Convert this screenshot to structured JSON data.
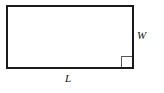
{
  "figure": {
    "type": "geometry-diagram",
    "shape": "rectangle",
    "background_color": "#ffffff",
    "stroke_color": "#1a1a1a",
    "stroke_width_px": 2,
    "marker_stroke_color": "#555555",
    "marker_stroke_width_px": 1,
    "rectangle": {
      "x": 7,
      "y": 6,
      "width": 126,
      "height": 62
    },
    "right_angle_marker": {
      "name": "right-angle-marker",
      "corner": "bottom-right",
      "size_px": 11,
      "x": 121,
      "y": 56
    },
    "labels": {
      "width_label": "W",
      "length_label": "L"
    }
  }
}
